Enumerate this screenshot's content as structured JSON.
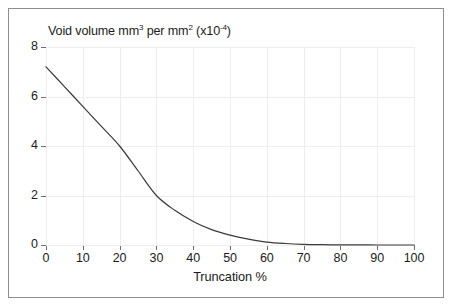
{
  "figure": {
    "width": 454,
    "height": 308,
    "background": "#ffffff",
    "frame_color": "#8d8d8d"
  },
  "chart_data": {
    "type": "line",
    "title": "Void volume mm3 per mm2 (x10-4)",
    "title_parts": {
      "lead": "Void volume mm",
      "sup1": "3",
      "mid": " per mm",
      "sup2": "2",
      "tail_open": " (x10",
      "sup3": "-4",
      "tail_close": ")"
    },
    "xlabel": "Truncation %",
    "ylabel": "Void volume mm3 per mm2 (x10-4)",
    "xlim": [
      0,
      100
    ],
    "ylim": [
      0,
      8
    ],
    "xticks": [
      "0",
      "10",
      "20",
      "30",
      "40",
      "50",
      "60",
      "70",
      "80",
      "90",
      "100"
    ],
    "xtick_values": [
      0,
      10,
      20,
      30,
      40,
      50,
      60,
      70,
      80,
      90,
      100
    ],
    "yticks": [
      "0",
      "2",
      "4",
      "6",
      "8"
    ],
    "ytick_values": [
      0,
      2,
      4,
      6,
      8
    ],
    "grid": true,
    "grid_color": "#ededed",
    "legend": null,
    "legend_position": "none",
    "series": [
      {
        "name": "Void volume",
        "color": "#3a3a3a",
        "line_width": 1.2,
        "x": [
          0,
          5,
          10,
          15,
          20,
          25,
          30,
          35,
          40,
          45,
          50,
          55,
          60,
          65,
          70,
          75,
          80,
          85,
          90,
          95,
          100
        ],
        "values": [
          7.2,
          6.4,
          5.6,
          4.8,
          4.0,
          3.0,
          2.0,
          1.4,
          0.95,
          0.62,
          0.4,
          0.24,
          0.12,
          0.06,
          0.025,
          0.012,
          0.006,
          0.003,
          0.001,
          0.0,
          0.0
        ]
      }
    ]
  }
}
